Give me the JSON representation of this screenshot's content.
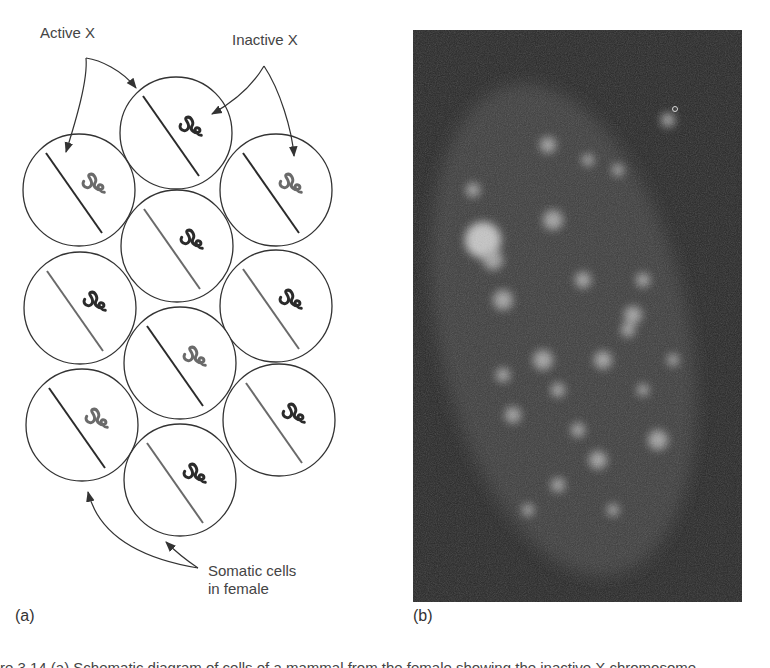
{
  "figure": {
    "panel_a": {
      "label": "(a)",
      "annotations": {
        "active_x": "Active X",
        "inactive_x": "Inactive X",
        "somatic_cells_line1": "Somatic cells",
        "somatic_cells_line2": "in female"
      },
      "cells": [
        {
          "id": "top-center",
          "cx": 176,
          "cy": 133,
          "active_line": "dark",
          "inactive_coil": "dark"
        },
        {
          "id": "left-1",
          "cx": 79,
          "cy": 190,
          "active_line": "dark",
          "inactive_coil": "gray"
        },
        {
          "id": "right-1",
          "cx": 276,
          "cy": 190,
          "active_line": "dark",
          "inactive_coil": "gray"
        },
        {
          "id": "center-2",
          "cx": 177,
          "cy": 246,
          "active_line": "gray",
          "inactive_coil": "dark"
        },
        {
          "id": "left-2",
          "cx": 80,
          "cy": 308,
          "active_line": "gray",
          "inactive_coil": "dark"
        },
        {
          "id": "right-2",
          "cx": 276,
          "cy": 306,
          "active_line": "gray",
          "inactive_coil": "dark"
        },
        {
          "id": "center-3",
          "cx": 180,
          "cy": 363,
          "active_line": "dark",
          "inactive_coil": "gray"
        },
        {
          "id": "left-3",
          "cx": 82,
          "cy": 425,
          "active_line": "dark",
          "inactive_coil": "gray"
        },
        {
          "id": "right-3",
          "cx": 279,
          "cy": 420,
          "active_line": "gray",
          "inactive_coil": "dark"
        },
        {
          "id": "center-4",
          "cx": 180,
          "cy": 480,
          "active_line": "gray",
          "inactive_coil": "dark"
        }
      ],
      "cell_radius": 56
    },
    "panel_b": {
      "label": "(b)",
      "description": "fluorescence micrograph of nucleus"
    },
    "caption_partial": "re 3.14 (a) Schematic diagram of cells of a mammal from the female showing the inactive X chromosome"
  },
  "colors": {
    "line_dark": "#2b2b2b",
    "line_gray": "#6a6a6a",
    "micrograph_bg": "#262626",
    "micrograph_glow": "#d8d8d8"
  }
}
